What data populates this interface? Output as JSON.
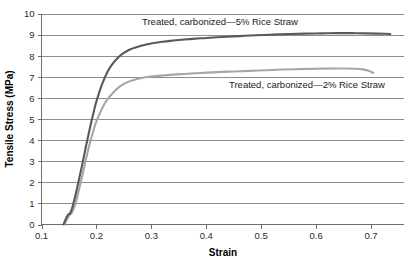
{
  "chart_data": {
    "type": "line",
    "title": "",
    "xlabel": "Strain",
    "ylabel": "Tensile Stress (MPa)",
    "xlim": [
      0.1,
      0.76
    ],
    "ylim": [
      0,
      10
    ],
    "grid": true,
    "legend_position": "inline-annotations",
    "x_ticks": [
      "0.1",
      "0.2",
      "0.3",
      "0.4",
      "0.5",
      "0.6",
      "0.7"
    ],
    "x_tick_values": [
      0.1,
      0.2,
      0.3,
      0.4,
      0.5,
      0.6,
      0.7
    ],
    "y_ticks": [
      "0",
      "1",
      "2",
      "3",
      "4",
      "5",
      "6",
      "7",
      "8",
      "9",
      "10"
    ],
    "y_tick_values": [
      0,
      1,
      2,
      3,
      4,
      5,
      6,
      7,
      8,
      9,
      10
    ],
    "series": [
      {
        "name": "Treated, carbonized—5% Rice Straw",
        "color": "#595959",
        "stroke_width": 2.1,
        "annotation": "Treated, carbonized—5% Rice Straw",
        "x": [
          0.14,
          0.144,
          0.148,
          0.15,
          0.152,
          0.156,
          0.16,
          0.165,
          0.17,
          0.175,
          0.18,
          0.185,
          0.19,
          0.195,
          0.2,
          0.21,
          0.22,
          0.23,
          0.24,
          0.25,
          0.26,
          0.27,
          0.28,
          0.3,
          0.32,
          0.34,
          0.36,
          0.38,
          0.4,
          0.43,
          0.46,
          0.49,
          0.52,
          0.55,
          0.58,
          0.61,
          0.64,
          0.665,
          0.69,
          0.71,
          0.725,
          0.735
        ],
        "y": [
          0.0,
          0.25,
          0.45,
          0.5,
          0.52,
          0.8,
          1.2,
          1.75,
          2.35,
          2.95,
          3.6,
          4.2,
          4.8,
          5.35,
          5.85,
          6.65,
          7.25,
          7.65,
          7.95,
          8.15,
          8.3,
          8.4,
          8.48,
          8.6,
          8.68,
          8.74,
          8.79,
          8.83,
          8.86,
          8.91,
          8.95,
          8.99,
          9.02,
          9.05,
          9.07,
          9.08,
          9.09,
          9.09,
          9.08,
          9.07,
          9.06,
          9.05
        ]
      },
      {
        "name": "Treated, carbonized—2% Rice Straw",
        "color": "#a6a6a6",
        "stroke_width": 2.1,
        "annotation": "Treated, carbonized—2% Rice Straw",
        "x": [
          0.142,
          0.146,
          0.15,
          0.152,
          0.155,
          0.16,
          0.165,
          0.17,
          0.175,
          0.18,
          0.185,
          0.19,
          0.195,
          0.2,
          0.21,
          0.22,
          0.23,
          0.24,
          0.25,
          0.26,
          0.27,
          0.28,
          0.3,
          0.32,
          0.34,
          0.36,
          0.39,
          0.42,
          0.45,
          0.48,
          0.51,
          0.54,
          0.57,
          0.6,
          0.63,
          0.655,
          0.672,
          0.685,
          0.694,
          0.7,
          0.704
        ],
        "y": [
          0.0,
          0.22,
          0.42,
          0.48,
          0.55,
          0.85,
          1.3,
          1.85,
          2.4,
          3.0,
          3.55,
          4.05,
          4.5,
          4.9,
          5.5,
          5.95,
          6.25,
          6.5,
          6.68,
          6.8,
          6.88,
          6.95,
          7.03,
          7.08,
          7.12,
          7.15,
          7.2,
          7.24,
          7.27,
          7.3,
          7.33,
          7.36,
          7.38,
          7.4,
          7.41,
          7.41,
          7.4,
          7.37,
          7.32,
          7.26,
          7.2
        ]
      }
    ]
  },
  "axes": {
    "x_title": "Strain",
    "y_title": "Tensile Stress (MPa)"
  }
}
